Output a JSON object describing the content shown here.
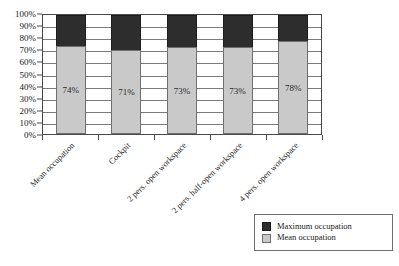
{
  "chart_data": {
    "type": "bar",
    "title": "",
    "subtitle": "",
    "xlabel": "",
    "ylabel": "",
    "stacked": true,
    "grid": true,
    "ylim": [
      0,
      100
    ],
    "y_ticks": [
      "0%",
      "10%",
      "20%",
      "30%",
      "40%",
      "50%",
      "60%",
      "70%",
      "80%",
      "90%",
      "100%"
    ],
    "y_tick_values": [
      0,
      10,
      20,
      30,
      40,
      50,
      60,
      70,
      80,
      90,
      100
    ],
    "categories": [
      "Mean occupation",
      "Cockpit",
      "2 pers. open workspace",
      "2 pers. half-open workspace",
      "4 pers. open workspace"
    ],
    "series": [
      {
        "name": "Mean occupation",
        "color": "#c9c9c9",
        "values": [
          74,
          71,
          73,
          73,
          78
        ],
        "data_labels": [
          "74%",
          "71%",
          "73%",
          "73%",
          "78%"
        ]
      },
      {
        "name": "Maximum occupation",
        "color": "#2d2d2d",
        "values": [
          26,
          29,
          27,
          27,
          22
        ],
        "data_labels": [
          "",
          "",
          "",
          "",
          ""
        ]
      }
    ],
    "legend": {
      "position": "bottom-right",
      "entries": [
        {
          "label": "Maximum occupation",
          "color": "#2d2d2d",
          "swatch": "max"
        },
        {
          "label": "Mean occupation",
          "color": "#c9c9c9",
          "swatch": "mean"
        }
      ]
    }
  }
}
